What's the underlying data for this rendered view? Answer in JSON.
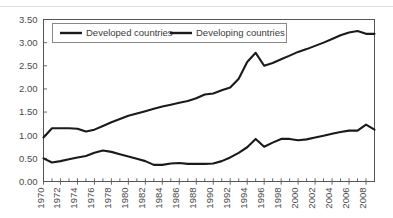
{
  "chart_data": {
    "type": "line",
    "title": "",
    "subtitle": "",
    "xlabel": "",
    "ylabel": "",
    "grid": false,
    "legend_position": "top-inside",
    "ylim": [
      0.0,
      3.5
    ],
    "ytick_labels": [
      "0.00",
      "0.50",
      "1.00",
      "1.50",
      "2.00",
      "2.50",
      "3.00",
      "3.50"
    ],
    "ytick_values": [
      0.0,
      0.5,
      1.0,
      1.5,
      2.0,
      2.5,
      3.0,
      3.5
    ],
    "xlim": [
      1970,
      2009
    ],
    "x": [
      1970,
      1971,
      1972,
      1973,
      1974,
      1975,
      1976,
      1977,
      1978,
      1979,
      1980,
      1981,
      1982,
      1983,
      1984,
      1985,
      1986,
      1987,
      1988,
      1989,
      1990,
      1991,
      1992,
      1993,
      1994,
      1995,
      1996,
      1997,
      1998,
      1999,
      2000,
      2001,
      2002,
      2003,
      2004,
      2005,
      2006,
      2007,
      2008,
      2009
    ],
    "xtick_labels": [
      "1970",
      "1972",
      "1974",
      "1976",
      "1978",
      "1980",
      "1982",
      "1984",
      "1986",
      "1988",
      "1990",
      "1992",
      "1994",
      "1996",
      "1998",
      "2000",
      "2002",
      "2004",
      "2006",
      "2008"
    ],
    "xtick_values": [
      1970,
      1972,
      1974,
      1976,
      1978,
      1980,
      1982,
      1984,
      1986,
      1988,
      1990,
      1992,
      1994,
      1996,
      1998,
      2000,
      2002,
      2004,
      2006,
      2008
    ],
    "series": [
      {
        "name": "Developed countries",
        "color": "#1a1a1a",
        "values": [
          0.95,
          1.15,
          1.15,
          1.15,
          1.14,
          1.08,
          1.12,
          1.2,
          1.28,
          1.35,
          1.42,
          1.47,
          1.52,
          1.57,
          1.62,
          1.66,
          1.7,
          1.74,
          1.8,
          1.88,
          1.9,
          1.97,
          2.03,
          2.22,
          2.58,
          2.78,
          2.5,
          2.56,
          2.64,
          2.72,
          2.8,
          2.86,
          2.93,
          3.0,
          3.08,
          3.16,
          3.22,
          3.25,
          3.19,
          3.19
        ]
      },
      {
        "name": "Developing countries",
        "color": "#1a1a1a",
        "values": [
          0.5,
          0.41,
          0.44,
          0.48,
          0.52,
          0.55,
          0.62,
          0.67,
          0.64,
          0.59,
          0.54,
          0.49,
          0.44,
          0.36,
          0.36,
          0.39,
          0.4,
          0.38,
          0.38,
          0.38,
          0.39,
          0.44,
          0.52,
          0.62,
          0.74,
          0.92,
          0.75,
          0.84,
          0.92,
          0.92,
          0.89,
          0.91,
          0.95,
          0.99,
          1.03,
          1.07,
          1.1,
          1.1,
          1.23,
          1.12
        ]
      }
    ]
  },
  "legend": {
    "items": [
      {
        "label": "Developed countries"
      },
      {
        "label": "Developing countries"
      }
    ]
  }
}
